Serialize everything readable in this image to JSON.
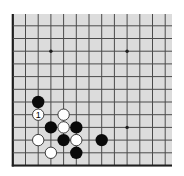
{
  "board": {
    "size": 19,
    "view": "bottom-left corner",
    "visible_columns": 13,
    "visible_rows": 12,
    "colors": {
      "background": "#dcdcdc",
      "line": "#4a4a4a",
      "edge": "#1e1e1e",
      "black_stone": "#0a0a0a",
      "white_stone": "#ffffff",
      "white_stone_outline": "#2a2a2a"
    },
    "star_points": [
      {
        "col": 4,
        "row": 10
      },
      {
        "col": 10,
        "row": 10
      },
      {
        "col": 10,
        "row": 4
      }
    ],
    "stones": [
      {
        "color": "black",
        "col": 3,
        "row": 6
      },
      {
        "color": "white",
        "col": 3,
        "row": 5,
        "label": "1"
      },
      {
        "color": "white",
        "col": 5,
        "row": 5
      },
      {
        "color": "black",
        "col": 4,
        "row": 4
      },
      {
        "color": "white",
        "col": 5,
        "row": 4
      },
      {
        "color": "black",
        "col": 6,
        "row": 4
      },
      {
        "color": "white",
        "col": 3,
        "row": 3
      },
      {
        "color": "black",
        "col": 5,
        "row": 3
      },
      {
        "color": "white",
        "col": 6,
        "row": 3
      },
      {
        "color": "black",
        "col": 8,
        "row": 3
      },
      {
        "color": "white",
        "col": 4,
        "row": 2
      },
      {
        "color": "black",
        "col": 6,
        "row": 2
      }
    ]
  }
}
